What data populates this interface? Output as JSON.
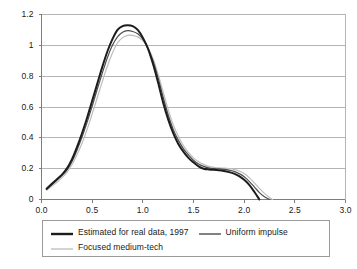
{
  "chart_data": {
    "type": "line",
    "title": "",
    "xlabel": "",
    "ylabel": "",
    "xlim": [
      0.0,
      3.0
    ],
    "ylim": [
      0.0,
      1.2
    ],
    "grid": "horizontal",
    "legend_position": "bottom",
    "x_ticks": [
      "0.0",
      "0.5",
      "1.0",
      "1.5",
      "2.0",
      "2.5",
      "3.0"
    ],
    "x_tick_values": [
      0.0,
      0.5,
      1.0,
      1.5,
      2.0,
      2.5,
      3.0
    ],
    "y_ticks": [
      "0",
      "0.2",
      "0.4",
      "0.6",
      "0.8",
      "1",
      "1.2"
    ],
    "y_tick_values": [
      0,
      0.2,
      0.4,
      0.6,
      0.8,
      1.0,
      1.2
    ],
    "series": [
      {
        "name": "Estimated for real data, 1997",
        "color": "#1c1c1c",
        "width": 2.0,
        "x": [
          0.05,
          0.1,
          0.15,
          0.2,
          0.25,
          0.3,
          0.35,
          0.4,
          0.45,
          0.5,
          0.55,
          0.6,
          0.65,
          0.7,
          0.75,
          0.8,
          0.85,
          0.9,
          0.95,
          1.0,
          1.05,
          1.1,
          1.15,
          1.2,
          1.25,
          1.3,
          1.35,
          1.4,
          1.45,
          1.5,
          1.55,
          1.6,
          1.65,
          1.7,
          1.75,
          1.8,
          1.85,
          1.9,
          1.95,
          2.0,
          2.05,
          2.1,
          2.15
        ],
        "y": [
          0.07,
          0.1,
          0.13,
          0.16,
          0.2,
          0.26,
          0.34,
          0.43,
          0.53,
          0.64,
          0.75,
          0.86,
          0.96,
          1.04,
          1.1,
          1.125,
          1.13,
          1.125,
          1.1,
          1.05,
          0.98,
          0.88,
          0.76,
          0.63,
          0.52,
          0.43,
          0.36,
          0.31,
          0.27,
          0.24,
          0.215,
          0.2,
          0.195,
          0.193,
          0.19,
          0.185,
          0.178,
          0.168,
          0.152,
          0.128,
          0.095,
          0.05,
          0.0
        ]
      },
      {
        "name": "Uniform impulse",
        "color": "#4d4d4d",
        "width": 1.2,
        "x": [
          0.05,
          0.1,
          0.15,
          0.2,
          0.25,
          0.3,
          0.35,
          0.4,
          0.45,
          0.5,
          0.55,
          0.6,
          0.65,
          0.7,
          0.75,
          0.8,
          0.85,
          0.9,
          0.95,
          1.0,
          1.05,
          1.1,
          1.15,
          1.2,
          1.25,
          1.3,
          1.35,
          1.4,
          1.45,
          1.5,
          1.55,
          1.6,
          1.65,
          1.7,
          1.75,
          1.8,
          1.85,
          1.9,
          1.95,
          2.0,
          2.05,
          2.1,
          2.15,
          2.2,
          2.25
        ],
        "y": [
          0.065,
          0.095,
          0.125,
          0.155,
          0.19,
          0.245,
          0.32,
          0.405,
          0.5,
          0.605,
          0.715,
          0.82,
          0.92,
          1.0,
          1.055,
          1.085,
          1.095,
          1.09,
          1.075,
          1.04,
          0.98,
          0.9,
          0.79,
          0.665,
          0.55,
          0.455,
          0.385,
          0.33,
          0.29,
          0.255,
          0.23,
          0.215,
          0.205,
          0.2,
          0.198,
          0.195,
          0.19,
          0.182,
          0.168,
          0.148,
          0.118,
          0.082,
          0.045,
          0.018,
          0.0
        ]
      },
      {
        "name": "Focused medium-tech",
        "color": "#bdbdbd",
        "width": 1.2,
        "x": [
          0.05,
          0.1,
          0.15,
          0.2,
          0.25,
          0.3,
          0.35,
          0.4,
          0.45,
          0.5,
          0.55,
          0.6,
          0.65,
          0.7,
          0.75,
          0.8,
          0.85,
          0.9,
          0.95,
          1.0,
          1.05,
          1.1,
          1.15,
          1.2,
          1.25,
          1.3,
          1.35,
          1.4,
          1.45,
          1.5,
          1.55,
          1.6,
          1.65,
          1.7,
          1.75,
          1.8,
          1.85,
          1.9,
          1.95,
          2.0,
          2.05,
          2.1,
          2.15,
          2.2,
          2.25,
          2.28
        ],
        "y": [
          0.06,
          0.085,
          0.11,
          0.14,
          0.175,
          0.225,
          0.29,
          0.365,
          0.455,
          0.555,
          0.66,
          0.765,
          0.865,
          0.95,
          1.015,
          1.05,
          1.065,
          1.065,
          1.055,
          1.03,
          0.985,
          0.915,
          0.815,
          0.7,
          0.585,
          0.485,
          0.41,
          0.35,
          0.305,
          0.27,
          0.245,
          0.228,
          0.215,
          0.208,
          0.205,
          0.203,
          0.2,
          0.195,
          0.185,
          0.168,
          0.142,
          0.108,
          0.072,
          0.04,
          0.013,
          0.0
        ]
      }
    ]
  },
  "legend": {
    "entries": [
      {
        "label": "Estimated for real data, 1997"
      },
      {
        "label": "Uniform impulse"
      },
      {
        "label": "Focused medium-tech"
      }
    ]
  },
  "colors": {
    "series_1": "#1c1c1c",
    "series_2": "#4d4d4d",
    "series_3": "#bdbdbd",
    "grid": "#b4b4b4",
    "axis": "#808080",
    "text": "#1a1a1a"
  }
}
